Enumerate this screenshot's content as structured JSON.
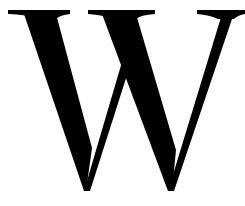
{
  "logo": {
    "glyph": "W",
    "icon": "wikipedia-w-icon",
    "color": "#000000",
    "background": "#ffffff"
  }
}
